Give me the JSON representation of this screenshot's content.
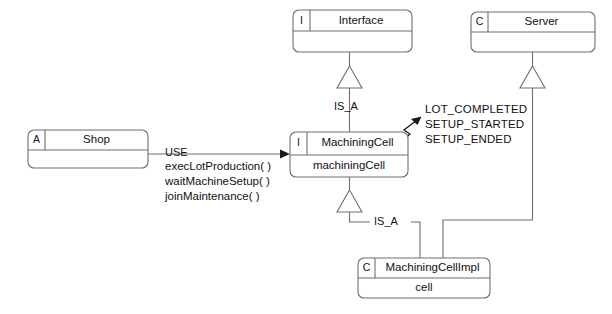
{
  "diagram": {
    "kind": "uml-class-diagram",
    "background_color": "#ffffff",
    "line_color": "#6e6e6e",
    "text_color": "#111111"
  },
  "classes": {
    "interface": {
      "stereotype": "I",
      "name": "Interface",
      "attribute": ""
    },
    "server": {
      "stereotype": "C",
      "name": "Server",
      "attribute": ""
    },
    "shop": {
      "stereotype": "A",
      "name": "Shop",
      "attribute": ""
    },
    "machining_cell": {
      "stereotype": "I",
      "name": "MachiningCell",
      "attribute": "machiningCell"
    },
    "machining_cell_impl": {
      "stereotype": "C",
      "name": "MachiningCellImpl",
      "attribute": "cell"
    }
  },
  "edges": {
    "is_a_interface": "IS_A",
    "is_a_impl": "IS_A",
    "use": "USE"
  },
  "use_methods": {
    "line1": "execLotProduction( )",
    "line2": "waitMachineSetup( )",
    "line3": "joinMaintenance( )"
  },
  "events": {
    "line1": "LOT_COMPLETED",
    "line2": "SETUP_STARTED",
    "line3": "SETUP_ENDED"
  }
}
